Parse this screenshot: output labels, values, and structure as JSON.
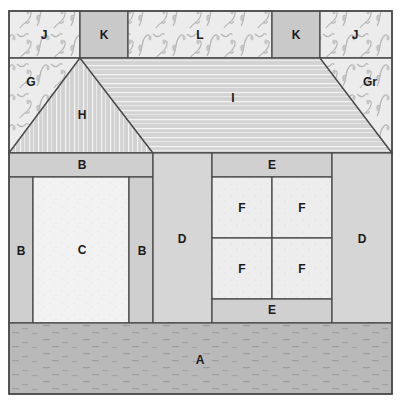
{
  "colors": {
    "outline": "#4a4a4a",
    "vine_fabric": "#ececec",
    "vine_motif": "#b8b8b8",
    "solid_K": "#c9c9c9",
    "stripe_base": "#d2d2d2",
    "stripe_line": "#f4f4f4",
    "B": "#cfcfcf",
    "C": "#f2f2f2",
    "D": "#d6d6d6",
    "E": "#d0d0d0",
    "F": "#ededed",
    "A": "#b9b9b9",
    "A_dash": "#9a9a9a"
  },
  "pieces": {
    "top_row": [
      {
        "id": "J",
        "label": "J",
        "fabric": "vine"
      },
      {
        "id": "K",
        "label": "K",
        "fabric": "solid"
      },
      {
        "id": "L",
        "label": "L",
        "fabric": "vine"
      },
      {
        "id": "K",
        "label": "K",
        "fabric": "solid"
      },
      {
        "id": "J",
        "label": "J",
        "fabric": "vine"
      }
    ],
    "roof": [
      {
        "id": "G",
        "label": "G",
        "fabric": "vine"
      },
      {
        "id": "H",
        "label": "H",
        "fabric": "vertical-stripe"
      },
      {
        "id": "I",
        "label": "I",
        "fabric": "horizontal-stripe"
      },
      {
        "id": "Gr",
        "label": "Gr",
        "fabric": "vine"
      }
    ],
    "door_section": {
      "top": {
        "id": "B",
        "label": "B"
      },
      "left": {
        "id": "B",
        "label": "B"
      },
      "door": {
        "id": "C",
        "label": "C"
      },
      "right": {
        "id": "B",
        "label": "B"
      }
    },
    "middle": {
      "id": "D",
      "label": "D"
    },
    "window_section": {
      "top": {
        "id": "E",
        "label": "E"
      },
      "panes": [
        {
          "id": "F",
          "label": "F"
        },
        {
          "id": "F",
          "label": "F"
        },
        {
          "id": "F",
          "label": "F"
        },
        {
          "id": "F",
          "label": "F"
        }
      ],
      "bottom": {
        "id": "E",
        "label": "E"
      }
    },
    "right": {
      "id": "D",
      "label": "D"
    },
    "ground": {
      "id": "A",
      "label": "A"
    }
  }
}
